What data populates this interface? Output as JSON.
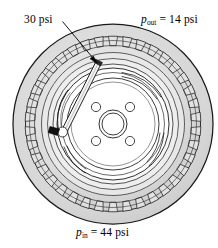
{
  "figure": {
    "background_color": "#ffffff",
    "width": 218,
    "height": 248
  },
  "annotations": {
    "gauge_reading": {
      "text": "30 psi",
      "value": 30,
      "unit": "psi",
      "role": "gauge-reading",
      "leader_line": true,
      "arrow": true
    },
    "outside_pressure": {
      "symbol": "p",
      "subscript": "out",
      "equals": "=",
      "value": "14",
      "unit": "psi",
      "full_text": "p_out = 14 psi",
      "role": "ambient-pressure"
    },
    "inside_pressure": {
      "symbol": "p",
      "subscript": "in",
      "equals": "=",
      "value": "44",
      "unit": "psi",
      "full_text": "p_in = 44 psi",
      "role": "absolute-pressure"
    }
  },
  "drawing": {
    "tire": {
      "center_x": 113,
      "center_y": 124,
      "outer_radius": 100,
      "tread_inner_radius": 88,
      "tread_block_count": 38,
      "sidewall_rings": [
        84,
        79,
        72,
        66,
        60
      ],
      "stroke_color": "#1a1a1a",
      "tread_fill": "#dcdcdc",
      "sidewall_fill": "#cfcfcf",
      "sidewall_fill_light": "#e6e6e6"
    },
    "wheel": {
      "rim_radius": 56,
      "hub_face_radius": 46,
      "lug_circle_radius": 24,
      "lug_count": 4,
      "lug_hole_radius": 4.6,
      "center_bore_outer_radius": 14,
      "center_bore_inner_radius": 11,
      "rim_fill": "#ffffff",
      "slot_count": 3
    },
    "gauge": {
      "tip_x": 57,
      "tip_y": 130,
      "top_x": 99,
      "top_y": 63,
      "body_color": "#f2f2f2",
      "tip_color": "#111111",
      "stroke_color": "#1a1a1a"
    },
    "leader": {
      "from_x": 63,
      "from_y": 22,
      "to_x": 96,
      "to_y": 62
    }
  }
}
